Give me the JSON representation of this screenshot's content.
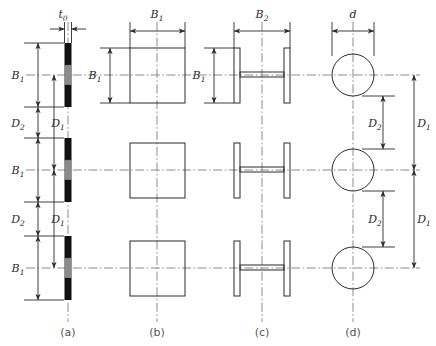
{
  "figure": {
    "type": "engineering-cross-section-diagram",
    "panels": [
      {
        "id": "a",
        "caption": "(a)",
        "shape": "thin-strip",
        "dimensions": [
          "t_0",
          "B_1",
          "D_2",
          "D_1"
        ]
      },
      {
        "id": "b",
        "caption": "(b)",
        "shape": "square",
        "dimensions": [
          "B_1"
        ]
      },
      {
        "id": "c",
        "caption": "(c)",
        "shape": "i-beam",
        "dimensions": [
          "B_2",
          "B_1"
        ]
      },
      {
        "id": "d",
        "caption": "(d)",
        "shape": "circle",
        "dimensions": [
          "d",
          "D_2",
          "D_1"
        ]
      }
    ],
    "rows": 3,
    "labels": {
      "t0_base": "t",
      "t0_sub": "0",
      "B_base": "B",
      "B1_sub": "1",
      "B2_sub": "2",
      "D_base": "D",
      "D1_sub": "1",
      "D2_sub": "2",
      "d": "d"
    },
    "colors": {
      "line": "#2b2b2b",
      "centerline": "#707070",
      "fill_dark": "#111111",
      "fill_mid": "#8a8a8a",
      "caption": "#555555",
      "background": "#ffffff"
    }
  }
}
